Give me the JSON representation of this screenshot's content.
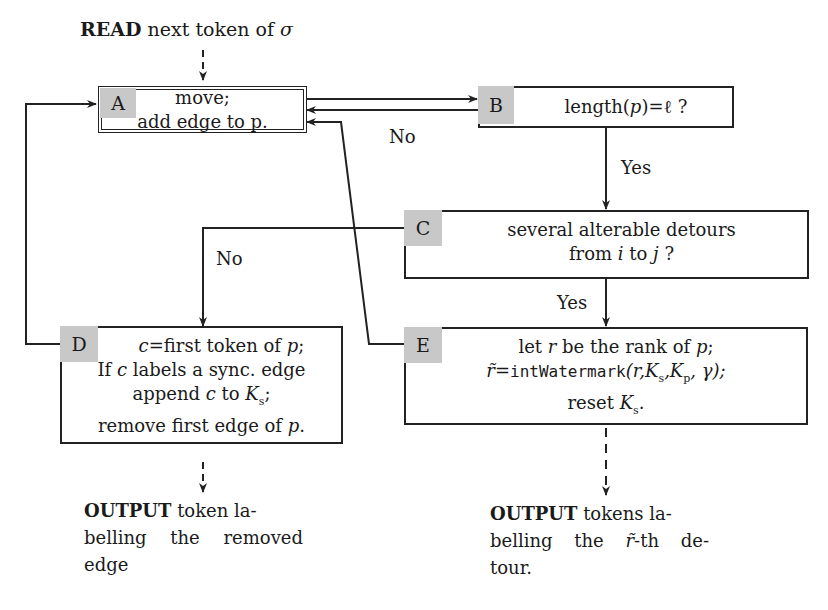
{
  "read": {
    "keyword": "READ",
    "rest": " next token of ",
    "symbol": "σ"
  },
  "boxes": {
    "A": {
      "tag": "A",
      "line1": "move;",
      "line2": "add edge to p."
    },
    "B": {
      "tag": "B",
      "text_pre": "length(",
      "var": "p",
      "text_post": ")=ℓ ?"
    },
    "C": {
      "tag": "C",
      "line1": "several alterable detours",
      "line2_pre": "from ",
      "i": "i",
      "mid": " to ",
      "j": "j",
      "end": " ?"
    },
    "D": {
      "tag": "D",
      "line1_var": "c",
      "line1_rest": "=first token of ",
      "line1_p": "p",
      "line1_end": ";",
      "line2_pre": "If ",
      "line2_var": "c",
      "line2_rest": " labels a sync. edge",
      "line3_pre": "append ",
      "line3_var": "c",
      "line3_mid": " to ",
      "line3_K": "K",
      "line3_sub": "s",
      "line3_end": ";",
      "line4_pre": "remove first edge of ",
      "line4_p": "p",
      "line4_end": "."
    },
    "E": {
      "tag": "E",
      "line1_pre": "let ",
      "line1_r": "r",
      "line1_mid": " be the rank of ",
      "line1_p": "p",
      "line1_end": ";",
      "line2_rt": "r̃",
      "line2_eq": "=",
      "line2_fn": "intWatermark",
      "line2_args": "(r,K",
      "line2_s": "s",
      "line2_k2": ",K",
      "line2_p": "p",
      "line2_end": ", γ);",
      "line3_pre": "reset ",
      "line3_K": "K",
      "line3_sub": "s",
      "line3_end": "."
    }
  },
  "edge_labels": {
    "b_no": "No",
    "b_yes": "Yes",
    "c_no": "No",
    "c_yes": "Yes"
  },
  "outputs": {
    "left": {
      "keyword": "OUTPUT",
      "line1": " token la-",
      "line2": "belling the removed",
      "line3": "edge"
    },
    "right": {
      "keyword": "OUTPUT",
      "line1": " tokens la-",
      "line2_pre": "belling the ",
      "line2_rt": "r̃",
      "line2_post": "-th de-",
      "line3": "tour."
    }
  }
}
